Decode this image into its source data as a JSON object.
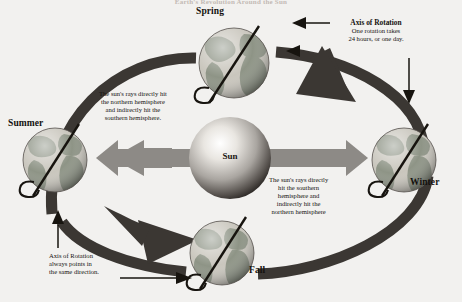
{
  "title": "Earth's Revolution Around the Sun",
  "seasons": [
    {
      "key": "spring",
      "label": "Spring"
    },
    {
      "key": "summer",
      "label": "Summer"
    },
    {
      "key": "winter",
      "label": "Winter"
    },
    {
      "key": "fall",
      "label": "Fall"
    }
  ],
  "sun": {
    "label": "Sun"
  },
  "notes": {
    "axis_top": {
      "heading": "Axis of Rotation",
      "line1": "One rotation takes",
      "line2": "24 hours, or one day."
    },
    "northern": {
      "line1": "The sun's rays directly hit",
      "line2": "the northern hemisphere",
      "line3": "and indirectly hit the",
      "line4": "southern hemisphere."
    },
    "southern": {
      "line1": "The sun's rays directly",
      "line2": "hit the southern",
      "line3": "hemisphere and",
      "line4": "indirectly hit the",
      "line5": "northern hemisphere"
    },
    "axis_bottom": {
      "line1": "Axis of Rotation",
      "line2": "always points in",
      "line3": "the same direction."
    }
  },
  "colors": {
    "background": "#f2f1ef",
    "orbit_arrow": "#3b3733",
    "sun_arrow": "#8d8a86",
    "sun_core": "#ffffff",
    "sun_edge": "#2f2b28",
    "land": "#8e9486",
    "ocean": "#c9c6bd",
    "text": "#15120f"
  },
  "icons": {
    "globe": "globe-icon",
    "axis_line": "axis-line-icon",
    "rotation_curl": "rotation-curl-icon",
    "orbit_arrow": "orbit-arrow-icon",
    "sun_ray_arrow": "sun-ray-double-arrow-icon",
    "pointer": "pointer-arrow-icon"
  }
}
